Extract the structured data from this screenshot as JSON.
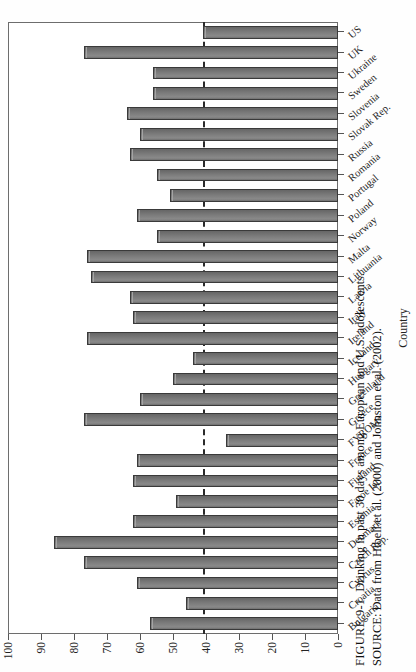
{
  "figure": {
    "number": "FIGURE 9-1",
    "caption": "Drinking in past 30 days among European and U.S. adolescents.",
    "source": "SOURCE: Data from Hibell et al. (2000) and Johnston et al. (2002)."
  },
  "chart_data": {
    "type": "bar",
    "title": "Drinking in past 30 days among European and U.S. adolescents.",
    "xlabel": "Country",
    "ylabel": "Percent",
    "ylim": [
      0,
      100
    ],
    "yticks": [
      0,
      10,
      20,
      30,
      40,
      50,
      60,
      70,
      80,
      90,
      100
    ],
    "grid": false,
    "legend": "none",
    "orientation": "vertical",
    "reference_line": {
      "value": 41,
      "style": "dashed",
      "label": "U.S. level"
    },
    "categories": [
      "Bulgaria",
      "Croatia",
      "Cyprus",
      "Czech Rep.",
      "Denmark",
      "Estonia",
      "Faroe Isl.",
      "Finland",
      "France",
      "FYROM*",
      "Greece",
      "Greenland",
      "Hungary",
      "Iceland",
      "Ireland",
      "Italy",
      "Latvia",
      "Lithuania",
      "Malta",
      "Norway",
      "Poland",
      "Portugal",
      "Romania",
      "Russia",
      "Slovak Rep.",
      "Slovenia",
      "Sweden",
      "Ukraine",
      "UK",
      "US"
    ],
    "values": [
      57,
      46,
      61,
      77,
      86,
      62,
      49,
      62,
      61,
      34,
      77,
      60,
      50,
      44,
      76,
      62,
      63,
      75,
      76,
      55,
      61,
      51,
      55,
      63,
      60,
      64,
      56,
      56,
      77,
      41
    ]
  }
}
